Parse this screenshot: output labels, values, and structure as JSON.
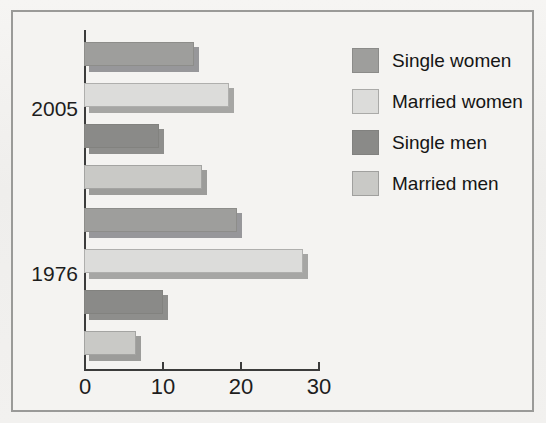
{
  "chart_data": {
    "type": "bar",
    "orientation": "horizontal",
    "title": "",
    "subtitle": "",
    "xlabel": "",
    "ylabel": "",
    "categories": [
      "2005",
      "1976"
    ],
    "xlim": [
      0,
      30
    ],
    "xticks": [
      0,
      10,
      20,
      30
    ],
    "xtick_labels": [
      "0",
      "10",
      "20",
      "30"
    ],
    "grid": false,
    "legend_position": "right",
    "series": [
      {
        "name": "Single women",
        "color": "#9e9e9c",
        "values": [
          14,
          19.5
        ]
      },
      {
        "name": "Married women",
        "color": "#dcdcda",
        "values": [
          18.5,
          28
        ]
      },
      {
        "name": "Single men",
        "color": "#8a8a88",
        "values": [
          9.5,
          10
        ]
      },
      {
        "name": "Married men",
        "color": "#c9c9c6",
        "values": [
          15,
          6.5
        ]
      }
    ]
  },
  "axis": {
    "ticks": [
      {
        "label": "0",
        "value": 0
      },
      {
        "label": "10",
        "value": 10
      },
      {
        "label": "20",
        "value": 20
      },
      {
        "label": "30",
        "value": 30
      }
    ]
  },
  "groups": [
    {
      "label": "2005",
      "bars": [
        {
          "series": "Single women",
          "value": 14,
          "color": "#9e9e9c",
          "class": "s-single-women"
        },
        {
          "series": "Married women",
          "value": 18.5,
          "color": "#dcdcda",
          "class": "s-married-women"
        },
        {
          "series": "Single men",
          "value": 9.5,
          "color": "#8a8a88",
          "class": "s-single-men"
        },
        {
          "series": "Married men",
          "value": 15,
          "color": "#c9c9c6",
          "class": "s-married-men"
        }
      ]
    },
    {
      "label": "1976",
      "bars": [
        {
          "series": "Single women",
          "value": 19.5,
          "color": "#9e9e9c",
          "class": "s-single-women"
        },
        {
          "series": "Married women",
          "value": 28,
          "color": "#dcdcda",
          "class": "s-married-women"
        },
        {
          "series": "Single men",
          "value": 10,
          "color": "#8a8a88",
          "class": "s-single-men"
        },
        {
          "series": "Married men",
          "value": 6.5,
          "color": "#c9c9c6",
          "class": "s-married-men"
        }
      ]
    }
  ],
  "legend": {
    "items": [
      {
        "label": "Single women",
        "color": "#9e9e9c",
        "class": "sw-single-women"
      },
      {
        "label": "Married women",
        "color": "#dcdcda",
        "class": "sw-married-women"
      },
      {
        "label": "Single men",
        "color": "#8a8a88",
        "class": "sw-single-men"
      },
      {
        "label": "Married men",
        "color": "#c9c9c6",
        "class": "sw-married-men"
      }
    ]
  },
  "style": {
    "background": "#f3f2f0",
    "frame_border": "#9a9a98",
    "axis_color": "#3b3b3b",
    "text_color": "#1d1d1d"
  }
}
